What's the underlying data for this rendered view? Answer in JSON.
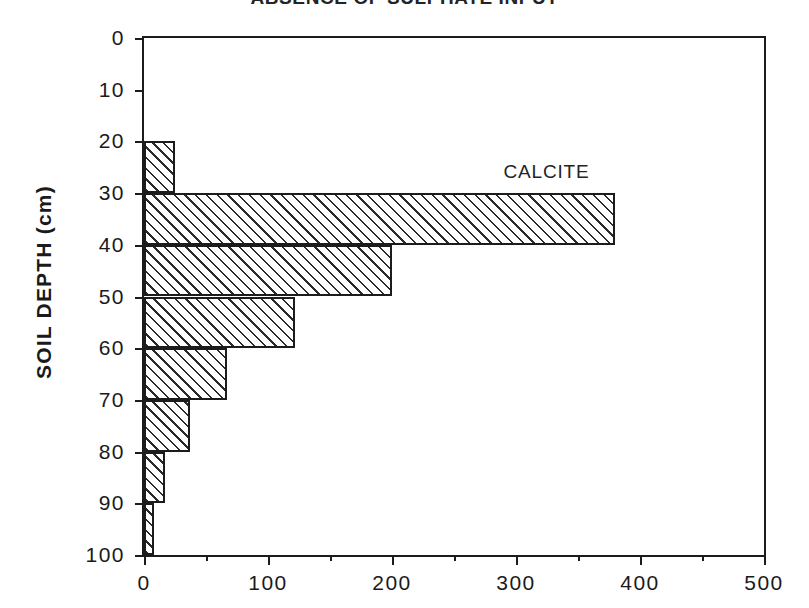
{
  "chart_data": {
    "type": "bar",
    "orientation": "horizontal",
    "title": "ABSENCE OF SULPHATE INPUT",
    "xlabel": "",
    "ylabel": "SOIL DEPTH (cm)",
    "xlim": [
      0,
      500
    ],
    "ylim": [
      0,
      100
    ],
    "y_inverted": true,
    "grid": false,
    "legend": false,
    "annotations": [
      {
        "text": "CALCITE",
        "x": 290,
        "y": 28
      }
    ],
    "xticks": [
      0,
      100,
      200,
      300,
      400,
      500
    ],
    "xtick_labels": [
      "0",
      "100",
      "200",
      "300",
      "400",
      "500"
    ],
    "xticks_minor": [
      50,
      150,
      250,
      350,
      450
    ],
    "yticks": [
      0,
      10,
      20,
      30,
      40,
      50,
      60,
      70,
      80,
      90,
      100
    ],
    "ytick_labels": [
      "0",
      "10",
      "20",
      "30",
      "40",
      "50",
      "60",
      "70",
      "80",
      "90",
      "100"
    ],
    "categories": [
      "0-10",
      "10-20",
      "20-30",
      "30-40",
      "40-50",
      "50-60",
      "60-70",
      "70-80",
      "80-90",
      "90-100"
    ],
    "bars": [
      {
        "depth_top": 0,
        "depth_bottom": 10,
        "value": 0
      },
      {
        "depth_top": 10,
        "depth_bottom": 20,
        "value": 0
      },
      {
        "depth_top": 20,
        "depth_bottom": 30,
        "value": 25
      },
      {
        "depth_top": 30,
        "depth_bottom": 40,
        "value": 380
      },
      {
        "depth_top": 40,
        "depth_bottom": 50,
        "value": 200
      },
      {
        "depth_top": 50,
        "depth_bottom": 60,
        "value": 122
      },
      {
        "depth_top": 60,
        "depth_bottom": 70,
        "value": 67
      },
      {
        "depth_top": 70,
        "depth_bottom": 80,
        "value": 37
      },
      {
        "depth_top": 80,
        "depth_bottom": 90,
        "value": 17
      },
      {
        "depth_top": 90,
        "depth_bottom": 100,
        "value": 8
      }
    ],
    "values": [
      0,
      0,
      25,
      380,
      200,
      122,
      67,
      37,
      17,
      8
    ],
    "series": [
      {
        "name": "CALCITE",
        "values": [
          0,
          0,
          25,
          380,
          200,
          122,
          67,
          37,
          17,
          8
        ]
      }
    ],
    "colors": {
      "axis": "#1c1c1c",
      "bar_edge": "#1c1c1c",
      "bar_hatch": "#2a2a2a",
      "bar_fill": "#ffffff",
      "background": "#ffffff",
      "text": "#1a1a1a"
    }
  }
}
